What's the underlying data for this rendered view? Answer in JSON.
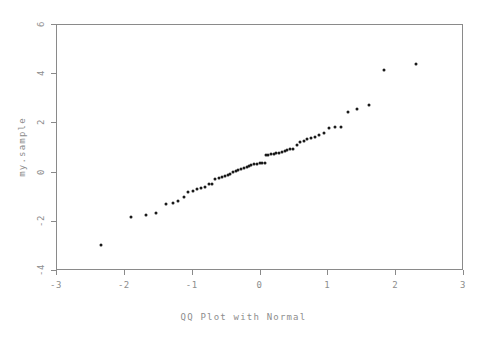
{
  "chart_data": {
    "type": "scatter",
    "title": "",
    "xlabel": "QQ Plot with Normal",
    "ylabel": "my.sample",
    "xlim": [
      -3,
      3
    ],
    "ylim": [
      -4,
      6
    ],
    "xticks": [
      -3,
      -2,
      -1,
      0,
      1,
      2,
      3
    ],
    "xtick_labels": [
      "-3",
      "-2",
      "-1",
      "0",
      "1",
      "2",
      "3"
    ],
    "yticks": [
      -4,
      -2,
      0,
      2,
      4,
      6
    ],
    "ytick_labels": [
      "-4",
      "-2",
      "0",
      "2",
      "4",
      "6"
    ],
    "grid": false,
    "legend": false,
    "marker": "point",
    "marker_color": "#1a1a1a",
    "axis_color": "#8a8a8a",
    "text_color": "#8d8d8d",
    "background_color": "#ffffff",
    "series": [
      {
        "name": "my.sample",
        "x": [
          -2.33,
          -1.89,
          -1.68,
          -1.53,
          -1.38,
          -1.28,
          -1.2,
          -1.12,
          -1.05,
          -0.98,
          -0.92,
          -0.86,
          -0.8,
          -0.75,
          -0.7,
          -0.65,
          -0.6,
          -0.56,
          -0.51,
          -0.47,
          -0.43,
          -0.39,
          -0.35,
          -0.31,
          -0.27,
          -0.23,
          -0.19,
          -0.16,
          -0.12,
          -0.08,
          -0.04,
          0.0,
          0.04,
          0.08,
          0.1,
          0.13,
          0.17,
          0.21,
          0.25,
          0.29,
          0.33,
          0.37,
          0.41,
          0.45,
          0.5,
          0.55,
          0.6,
          0.65,
          0.7,
          0.76,
          0.82,
          0.88,
          0.95,
          1.03,
          1.11,
          1.2,
          1.31,
          1.44,
          1.61,
          1.84,
          2.3
        ],
        "y": [
          -3.0,
          -1.86,
          -1.76,
          -1.7,
          -1.32,
          -1.28,
          -1.18,
          -1.03,
          -0.83,
          -0.78,
          -0.72,
          -0.68,
          -0.64,
          -0.52,
          -0.5,
          -0.3,
          -0.25,
          -0.21,
          -0.17,
          -0.12,
          -0.08,
          -0.03,
          0.02,
          0.08,
          0.12,
          0.16,
          0.2,
          0.24,
          0.27,
          0.3,
          0.32,
          0.33,
          0.34,
          0.35,
          0.66,
          0.68,
          0.7,
          0.72,
          0.74,
          0.76,
          0.79,
          0.82,
          0.86,
          0.9,
          0.92,
          1.1,
          1.2,
          1.26,
          1.32,
          1.38,
          1.42,
          1.5,
          1.58,
          1.78,
          1.8,
          1.8,
          2.44,
          2.56,
          2.7,
          4.12,
          4.36
        ]
      }
    ]
  }
}
